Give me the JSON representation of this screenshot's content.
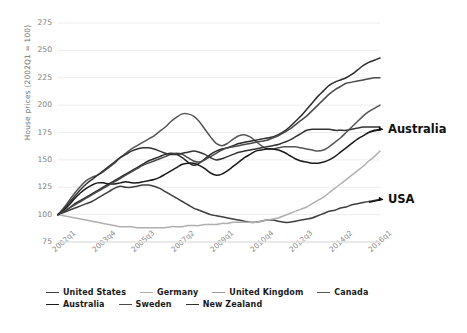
{
  "chart_data": {
    "type": "line",
    "title": "",
    "xlabel": "",
    "ylabel": "House prices (2002Q1 = 100)",
    "ylim": [
      75,
      275
    ],
    "yticks": [
      275,
      250,
      225,
      200,
      175,
      150,
      125,
      100,
      75
    ],
    "grid": true,
    "legend_position": "bottom",
    "x_tick_labels": [
      "2002q1",
      "2003q4",
      "2005q3",
      "2007q2",
      "2009q1",
      "2010q4",
      "2012q3",
      "2014q2",
      "2016q1"
    ],
    "x_index_range": [
      0,
      57
    ],
    "x_tick_indices": [
      0,
      7,
      14,
      21,
      28,
      35,
      42,
      49,
      56
    ],
    "annotations": [
      {
        "text": "Australia",
        "series": "Australia",
        "value": 178
      },
      {
        "text": "USA",
        "series": "United States",
        "value": 114
      }
    ],
    "series": [
      {
        "name": "United States",
        "color": "#3f3f3f",
        "values": [
          100,
          102,
          104,
          106,
          108,
          110,
          112,
          115,
          118,
          121,
          124,
          126,
          125,
          125,
          126,
          127,
          127,
          126,
          124,
          121,
          118,
          115,
          112,
          109,
          106,
          104,
          102,
          100,
          99,
          98,
          97,
          96,
          95,
          94,
          93,
          93,
          94,
          95,
          95,
          94,
          93,
          93,
          94,
          95,
          96,
          97,
          99,
          101,
          103,
          104,
          106,
          107,
          109,
          110,
          111,
          112,
          113,
          114
        ]
      },
      {
        "name": "Germany",
        "color": "#b0b0b0",
        "values": [
          100,
          99,
          98,
          97,
          96,
          95,
          94,
          93,
          92,
          91,
          90,
          89,
          89,
          89,
          88,
          88,
          88,
          88,
          88,
          88,
          89,
          89,
          89,
          90,
          90,
          90,
          91,
          91,
          91,
          92,
          92,
          93,
          93,
          93,
          93,
          93,
          94,
          95,
          96,
          97,
          99,
          101,
          103,
          105,
          107,
          110,
          113,
          116,
          120,
          124,
          128,
          132,
          136,
          140,
          144,
          149,
          153,
          158
        ]
      },
      {
        "name": "United Kingdom",
        "color": "#555555",
        "values": [
          100,
          106,
          113,
          120,
          126,
          131,
          134,
          136,
          139,
          143,
          147,
          152,
          156,
          160,
          163,
          166,
          169,
          172,
          176,
          180,
          185,
          189,
          192,
          192,
          190,
          185,
          178,
          171,
          165,
          163,
          165,
          169,
          172,
          173,
          171,
          167,
          163,
          160,
          160,
          161,
          162,
          162,
          162,
          161,
          160,
          159,
          158,
          159,
          162,
          166,
          170,
          175,
          180,
          185,
          190,
          194,
          197,
          200
        ]
      },
      {
        "name": "Canada",
        "color": "#2b2b2b",
        "values": [
          100,
          103,
          106,
          110,
          113,
          116,
          119,
          122,
          125,
          128,
          131,
          134,
          137,
          140,
          143,
          146,
          149,
          151,
          153,
          155,
          156,
          155,
          152,
          148,
          145,
          147,
          151,
          155,
          158,
          160,
          161,
          163,
          165,
          166,
          167,
          168,
          169,
          170,
          171,
          173,
          176,
          180,
          185,
          190,
          196,
          202,
          208,
          213,
          218,
          221,
          223,
          225,
          228,
          232,
          236,
          239,
          241,
          243
        ]
      },
      {
        "name": "Australia",
        "color": "#1a1a1a",
        "values": [
          100,
          104,
          109,
          115,
          120,
          124,
          127,
          129,
          129,
          128,
          128,
          129,
          130,
          129,
          129,
          130,
          131,
          132,
          134,
          137,
          140,
          143,
          146,
          147,
          147,
          145,
          142,
          138,
          136,
          137,
          140,
          144,
          148,
          152,
          155,
          158,
          159,
          160,
          160,
          159,
          157,
          154,
          151,
          149,
          148,
          147,
          147,
          148,
          150,
          153,
          157,
          161,
          165,
          169,
          172,
          175,
          177,
          178
        ]
      },
      {
        "name": "Sweden",
        "color": "#4a4a4a",
        "values": [
          100,
          103,
          106,
          109,
          112,
          115,
          118,
          121,
          124,
          127,
          130,
          133,
          136,
          139,
          142,
          145,
          147,
          149,
          151,
          153,
          155,
          156,
          155,
          152,
          149,
          148,
          150,
          153,
          156,
          159,
          161,
          162,
          163,
          164,
          165,
          166,
          167,
          168,
          170,
          172,
          175,
          178,
          182,
          186,
          190,
          195,
          200,
          205,
          210,
          214,
          217,
          220,
          221,
          222,
          223,
          224,
          225,
          225
        ]
      },
      {
        "name": "New Zealand",
        "color": "#333333",
        "values": [
          100,
          105,
          111,
          117,
          123,
          128,
          132,
          136,
          140,
          144,
          148,
          152,
          155,
          158,
          160,
          161,
          161,
          160,
          158,
          156,
          155,
          155,
          156,
          157,
          158,
          157,
          155,
          152,
          150,
          151,
          153,
          155,
          157,
          158,
          159,
          160,
          161,
          162,
          163,
          164,
          166,
          168,
          171,
          174,
          177,
          178,
          178,
          178,
          178,
          177,
          177,
          177,
          178,
          179,
          180,
          180,
          180,
          180
        ]
      }
    ]
  },
  "legend": {
    "row1": [
      {
        "label": "United States",
        "color": "#3f3f3f"
      },
      {
        "label": "Germany",
        "color": "#b0b0b0"
      },
      {
        "label": "United Kingdom",
        "color": "#9a9a9a"
      },
      {
        "label": "Canada",
        "color": "#555555"
      }
    ],
    "row2": [
      {
        "label": "Australia",
        "color": "#1a1a1a"
      },
      {
        "label": "Sweden",
        "color": "#4a4a4a"
      },
      {
        "label": "New Zealand",
        "color": "#333333"
      }
    ]
  },
  "axis": {
    "y_title": "House prices (2002Q1 = 100)"
  }
}
